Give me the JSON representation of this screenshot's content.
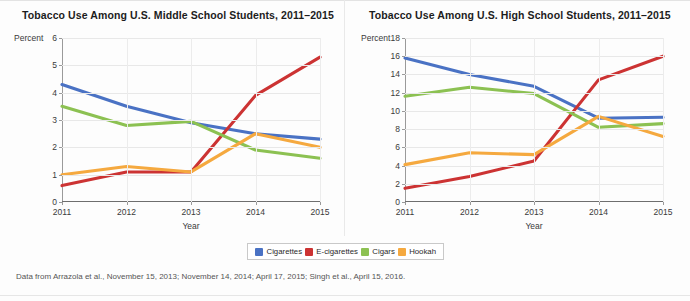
{
  "figure": {
    "caption": "Data from Arrazola et al., November 15, 2013; November 14, 2014; April 17, 2015; Singh et al., April 15, 2016."
  },
  "legend": {
    "items": [
      {
        "label": "Cigarettes",
        "color": "#4a72c4"
      },
      {
        "label": "E-cigarettes",
        "color": "#cc3333"
      },
      {
        "label": "Cigars",
        "color": "#8cc152"
      },
      {
        "label": "Hookah",
        "color": "#f5a93f"
      }
    ]
  },
  "chart_data": [
    {
      "type": "line",
      "title": "Tobacco Use Among U.S. Middle School Students, 2011–2015",
      "xlabel": "Year",
      "ylabel": "Percent",
      "categories": [
        "2011",
        "2012",
        "2013",
        "2014",
        "2015"
      ],
      "x": [
        2011,
        2012,
        2013,
        2014,
        2015
      ],
      "ylim": [
        0,
        6
      ],
      "yticks": [
        0,
        1,
        2,
        3,
        4,
        5,
        6
      ],
      "xlim": [
        2011,
        2015
      ],
      "grid": true,
      "legend_position": "bottom-center-shared",
      "series": [
        {
          "name": "Cigarettes",
          "color": "#4a72c4",
          "values": [
            4.3,
            3.5,
            2.9,
            2.5,
            2.3
          ]
        },
        {
          "name": "E-cigarettes",
          "color": "#cc3333",
          "values": [
            0.6,
            1.1,
            1.1,
            3.9,
            5.3
          ]
        },
        {
          "name": "Cigars",
          "color": "#8cc152",
          "values": [
            3.5,
            2.8,
            2.95,
            1.9,
            1.6
          ]
        },
        {
          "name": "Hookah",
          "color": "#f5a93f",
          "values": [
            1.0,
            1.3,
            1.1,
            2.5,
            2.0
          ]
        }
      ]
    },
    {
      "type": "line",
      "title": "Tobacco Use Among U.S. High School Students, 2011–2015",
      "xlabel": "Year",
      "ylabel": "Percent",
      "categories": [
        "2011",
        "2012",
        "2013",
        "2014",
        "2015"
      ],
      "x": [
        2011,
        2012,
        2013,
        2014,
        2015
      ],
      "ylim": [
        0,
        18
      ],
      "yticks": [
        0,
        2,
        4,
        6,
        8,
        10,
        12,
        14,
        16,
        18
      ],
      "xlim": [
        2011,
        2015
      ],
      "grid": true,
      "legend_position": "bottom-center-shared",
      "series": [
        {
          "name": "Cigarettes",
          "color": "#4a72c4",
          "values": [
            15.8,
            14.0,
            12.7,
            9.2,
            9.3
          ]
        },
        {
          "name": "E-cigarettes",
          "color": "#cc3333",
          "values": [
            1.5,
            2.8,
            4.5,
            13.4,
            16.0
          ]
        },
        {
          "name": "Cigars",
          "color": "#8cc152",
          "values": [
            11.6,
            12.6,
            11.9,
            8.2,
            8.6
          ]
        },
        {
          "name": "Hookah",
          "color": "#f5a93f",
          "values": [
            4.1,
            5.4,
            5.2,
            9.4,
            7.2
          ]
        }
      ]
    }
  ]
}
